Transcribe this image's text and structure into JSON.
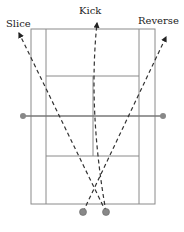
{
  "diagram": {
    "labels": {
      "slice": "Slice",
      "kick": "Kick",
      "reverse": "Reverse"
    },
    "colors": {
      "court_line": "#8a8a8a",
      "net": "#777777",
      "trajectory": "#333333",
      "ball": "#888888"
    }
  }
}
